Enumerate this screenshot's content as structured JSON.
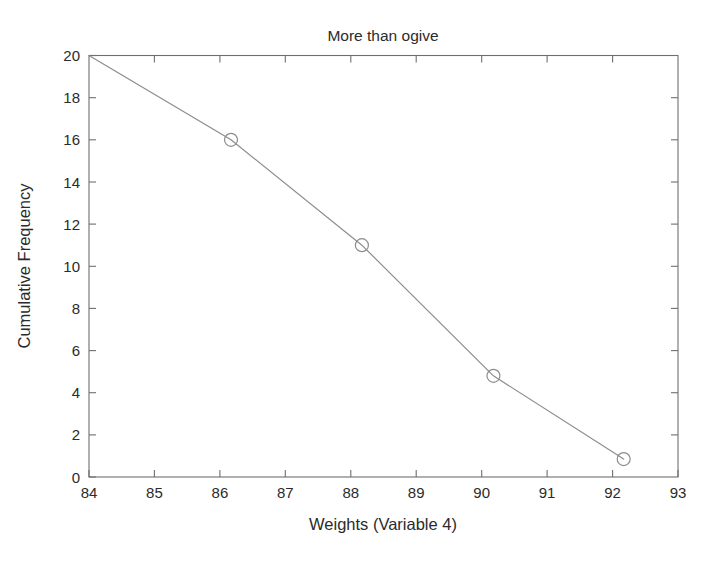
{
  "figure": {
    "background_color": "#ffffff",
    "axis_color": "#6f6f6f",
    "line_color": "#8d8d8d",
    "text_color": "#2b2b2b"
  },
  "chart_data": {
    "type": "line",
    "title": "More than ogive",
    "xlabel": "Weights (Variable 4)",
    "ylabel": "Cumulative Frequency",
    "xlim": [
      84,
      93
    ],
    "ylim": [
      0,
      20
    ],
    "xticks": [
      84,
      85,
      86,
      87,
      88,
      89,
      90,
      91,
      92,
      93
    ],
    "yticks": [
      0,
      2,
      4,
      6,
      8,
      10,
      12,
      14,
      16,
      18,
      20
    ],
    "xtick_labels": [
      "84",
      "85",
      "86",
      "87",
      "88",
      "89",
      "90",
      "91",
      "92",
      "93"
    ],
    "ytick_labels": [
      "0",
      "2",
      "4",
      "6",
      "8",
      "10",
      "12",
      "14",
      "16",
      "18",
      "20"
    ],
    "grid": false,
    "legend": null,
    "box": true,
    "tick_direction": "in",
    "series": [
      {
        "name": "More than cumulative frequency",
        "marker": "circle",
        "x": [
          84.0,
          86.17,
          88.17,
          90.18,
          92.17
        ],
        "y": [
          20.0,
          16.0,
          11.0,
          4.8,
          0.85
        ],
        "markers_shown_at": [
          86.17,
          88.17,
          90.18,
          92.17
        ]
      }
    ]
  }
}
